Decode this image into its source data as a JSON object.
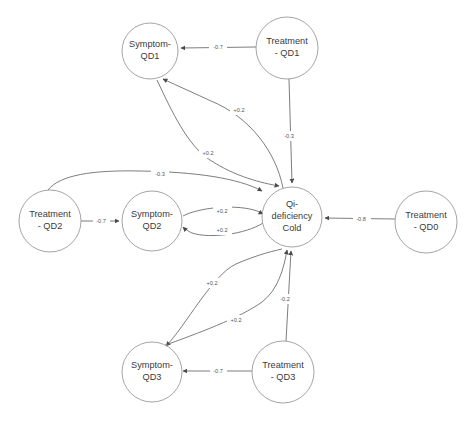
{
  "diagram": {
    "type": "causal-graph",
    "background_color": "#ffffff",
    "node_stroke_color": "#9a9a9a",
    "edge_stroke_color": "#6e6e6e",
    "label_text_color": "#3a3a3a",
    "nodes": [
      {
        "id": "symptom-qd1",
        "lines": [
          "Symptom-",
          "QD1"
        ],
        "cx": 150,
        "cy": 51,
        "r": 28
      },
      {
        "id": "treatment-qd1",
        "lines": [
          "Treatment",
          "- QD1"
        ],
        "cx": 287,
        "cy": 48,
        "r": 31
      },
      {
        "id": "treatment-qd2",
        "lines": [
          "Treatment",
          "- QD2"
        ],
        "cx": 50,
        "cy": 221,
        "r": 31
      },
      {
        "id": "symptom-qd2",
        "lines": [
          "Symptom-",
          "QD2"
        ],
        "cx": 152,
        "cy": 221,
        "r": 30
      },
      {
        "id": "qi-deficiency-cold",
        "lines": [
          "Qi-",
          "deficiency",
          "Cold"
        ],
        "cx": 292,
        "cy": 217,
        "r": 30
      },
      {
        "id": "treatment-qd0",
        "lines": [
          "Treatment",
          "- QD0"
        ],
        "cx": 426,
        "cy": 222,
        "r": 31
      },
      {
        "id": "symptom-qd3",
        "lines": [
          "Symptom-",
          "QD3"
        ],
        "cx": 152,
        "cy": 372,
        "r": 30
      },
      {
        "id": "treatment-qd3",
        "lines": [
          "Treatment",
          "- QD3"
        ],
        "cx": 283,
        "cy": 372,
        "r": 31
      }
    ],
    "edges": [
      {
        "id": "e-tqd1-sqd1",
        "from": "treatment-qd1",
        "to": "symptom-qd1",
        "weight": "-0.7",
        "label_x": 218,
        "label_y": 47
      },
      {
        "id": "e-tqd1-qdc",
        "from": "treatment-qd1",
        "to": "qi-deficiency-cold",
        "weight": "-0.3",
        "label_x": 289,
        "label_y": 136
      },
      {
        "id": "e-qdc-sqd1",
        "from": "qi-deficiency-cold",
        "to": "symptom-qd1",
        "weight": "+0.2",
        "label_x": 239,
        "label_y": 110
      },
      {
        "id": "e-sqd1-qdc",
        "from": "symptom-qd1",
        "to": "qi-deficiency-cold",
        "weight": "+0.2",
        "label_x": 208,
        "label_y": 153
      },
      {
        "id": "e-tqd2-sqd2",
        "from": "treatment-qd2",
        "to": "symptom-qd2",
        "weight": "-0.7",
        "label_x": 101,
        "label_y": 220
      },
      {
        "id": "e-tqd2-qdc",
        "from": "treatment-qd2",
        "to": "qi-deficiency-cold",
        "weight": "-0.3",
        "label_x": 160,
        "label_y": 174
      },
      {
        "id": "e-sqd2-qdc",
        "from": "symptom-qd2",
        "to": "qi-deficiency-cold",
        "weight": "+0.2",
        "label_x": 222,
        "label_y": 211
      },
      {
        "id": "e-qdc-sqd2",
        "from": "qi-deficiency-cold",
        "to": "symptom-qd2",
        "weight": "+0.2",
        "label_x": 222,
        "label_y": 230
      },
      {
        "id": "e-tqd0-qdc",
        "from": "treatment-qd0",
        "to": "qi-deficiency-cold",
        "weight": "-0.8",
        "label_x": 361,
        "label_y": 219
      },
      {
        "id": "e-qdc-sqd3",
        "from": "qi-deficiency-cold",
        "to": "symptom-qd3",
        "weight": "+0.2",
        "label_x": 212,
        "label_y": 283
      },
      {
        "id": "e-sqd3-qdc",
        "from": "symptom-qd3",
        "to": "qi-deficiency-cold",
        "weight": "+0.2",
        "label_x": 236,
        "label_y": 320
      },
      {
        "id": "e-tqd3-qdc",
        "from": "treatment-qd3",
        "to": "qi-deficiency-cold",
        "weight": "-0.2",
        "label_x": 285,
        "label_y": 299
      },
      {
        "id": "e-tqd3-sqd3",
        "from": "treatment-qd3",
        "to": "symptom-qd3",
        "weight": "-0.7",
        "label_x": 218,
        "label_y": 370
      }
    ]
  }
}
